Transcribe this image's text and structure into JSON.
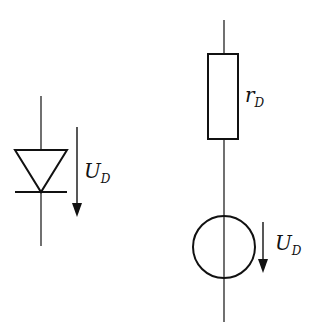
{
  "diagram": {
    "left": {
      "component": "diode",
      "voltage_label": {
        "main": "U",
        "sub": "D"
      }
    },
    "right": {
      "resistor": {
        "component": "resistor",
        "label": {
          "main": "r",
          "sub": "D"
        }
      },
      "source": {
        "component": "voltage-source",
        "label": {
          "main": "U",
          "sub": "D"
        }
      }
    },
    "colors": {
      "stroke": "#111111",
      "background": "#ffffff"
    }
  }
}
